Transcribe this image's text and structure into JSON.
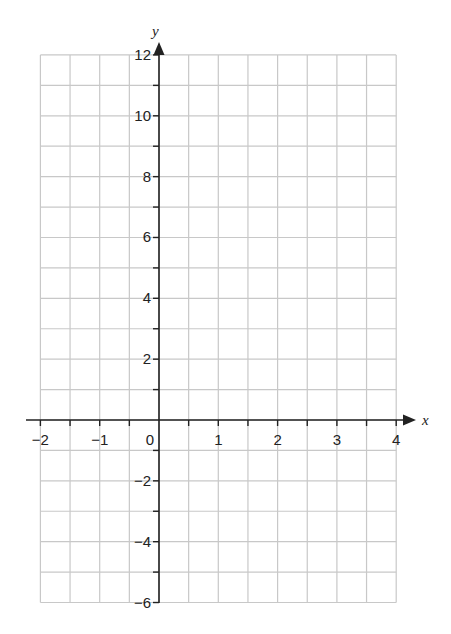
{
  "chart_data": {
    "type": "line",
    "title": "",
    "xlabel": "x",
    "ylabel": "y",
    "xlim": [
      -2,
      4
    ],
    "ylim": [
      -6,
      12
    ],
    "x_ticks": [
      "−2",
      "−1",
      "0",
      "1",
      "2",
      "3",
      "4"
    ],
    "y_ticks": [
      "12",
      "10",
      "8",
      "6",
      "4",
      "2",
      "−2",
      "−4",
      "−6"
    ],
    "x_grid_step": 0.5,
    "y_grid_step": 1,
    "grid": true,
    "series": [],
    "legend": null
  },
  "colors": {
    "grid": "#c8c8c8",
    "axis": "#222222"
  }
}
